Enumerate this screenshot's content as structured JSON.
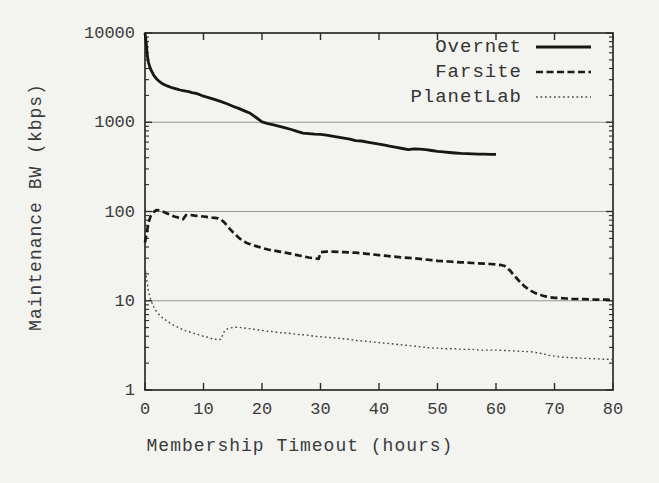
{
  "chart_data": {
    "type": "line",
    "title": "",
    "xlabel": "Membership Timeout (hours)",
    "ylabel": "Maintenance BW (kbps)",
    "x_axis": {
      "min": 0,
      "max": 80,
      "ticks": [
        0,
        10,
        20,
        30,
        40,
        50,
        60,
        70,
        80
      ],
      "label": "Membership Timeout (hours)"
    },
    "y_axis": {
      "scale": "log",
      "min": 1,
      "max": 10000,
      "ticks": [
        1,
        10,
        100,
        1000,
        10000
      ],
      "tick_labels": [
        "1",
        "10",
        "100",
        "1000",
        "10000"
      ],
      "gridlines": [
        10,
        100,
        1000
      ],
      "label": "Maintenance BW (kbps)"
    },
    "legend_position": "top-right",
    "grid": "horizontal-decades",
    "colors": {
      "line": "#1c1c1c",
      "dotted_line": "#454545",
      "axis": "#2b2b2b",
      "grid": "#969696",
      "background": "#f3f3f0"
    },
    "series": [
      {
        "name": "Overnet",
        "style": "solid",
        "dash": "",
        "stroke_width": 2.8,
        "color": "#161616",
        "points": [
          [
            0,
            10000
          ],
          [
            0.2,
            7800
          ],
          [
            0.4,
            5600
          ],
          [
            0.6,
            4700
          ],
          [
            0.8,
            4200
          ],
          [
            1,
            3900
          ],
          [
            1.5,
            3350
          ],
          [
            2,
            3050
          ],
          [
            2.5,
            2850
          ],
          [
            3,
            2700
          ],
          [
            3.5,
            2600
          ],
          [
            4,
            2520
          ],
          [
            4.5,
            2450
          ],
          [
            5,
            2400
          ],
          [
            5.5,
            2350
          ],
          [
            6,
            2300
          ],
          [
            6.5,
            2260
          ],
          [
            7,
            2230
          ],
          [
            7.5,
            2200
          ],
          [
            8,
            2150
          ],
          [
            8.5,
            2120
          ],
          [
            9,
            2080
          ],
          [
            9.5,
            2020
          ],
          [
            10,
            1960
          ],
          [
            11,
            1880
          ],
          [
            12,
            1790
          ],
          [
            13,
            1700
          ],
          [
            14,
            1610
          ],
          [
            15,
            1510
          ],
          [
            16,
            1430
          ],
          [
            17,
            1340
          ],
          [
            18,
            1260
          ],
          [
            19,
            1130
          ],
          [
            20,
            1010
          ],
          [
            21,
            965
          ],
          [
            22,
            935
          ],
          [
            23,
            900
          ],
          [
            24,
            865
          ],
          [
            25,
            830
          ],
          [
            26,
            790
          ],
          [
            27,
            755
          ],
          [
            28,
            745
          ],
          [
            29,
            735
          ],
          [
            30,
            730
          ],
          [
            31,
            718
          ],
          [
            32,
            700
          ],
          [
            33,
            682
          ],
          [
            34,
            662
          ],
          [
            35,
            645
          ],
          [
            36,
            622
          ],
          [
            37,
            616
          ],
          [
            38,
            600
          ],
          [
            39,
            583
          ],
          [
            40,
            568
          ],
          [
            41,
            553
          ],
          [
            42,
            538
          ],
          [
            43,
            523
          ],
          [
            44,
            508
          ],
          [
            45,
            493
          ],
          [
            46,
            504
          ],
          [
            47,
            500
          ],
          [
            48,
            494
          ],
          [
            49,
            483
          ],
          [
            50,
            472
          ],
          [
            51,
            465
          ],
          [
            52,
            458
          ],
          [
            53,
            452
          ],
          [
            54,
            448
          ],
          [
            55,
            445
          ],
          [
            56,
            442
          ],
          [
            57,
            440
          ],
          [
            58,
            438
          ],
          [
            59,
            437
          ],
          [
            60,
            436
          ]
        ]
      },
      {
        "name": "Farsite",
        "style": "dashed",
        "dash": "7 3.5",
        "stroke_width": 2.7,
        "color": "#1a1a1a",
        "points": [
          [
            0,
            45
          ],
          [
            0.3,
            58
          ],
          [
            0.6,
            75
          ],
          [
            1,
            90
          ],
          [
            1.5,
            99
          ],
          [
            2,
            104
          ],
          [
            2.5,
            103
          ],
          [
            3,
            100
          ],
          [
            3.5,
            97
          ],
          [
            4,
            94
          ],
          [
            4.5,
            91
          ],
          [
            5,
            88
          ],
          [
            5.5,
            86
          ],
          [
            6,
            84
          ],
          [
            6.5,
            82
          ],
          [
            7,
            91
          ],
          [
            7.5,
            92
          ],
          [
            8,
            91
          ],
          [
            8.5,
            90
          ],
          [
            9,
            89
          ],
          [
            9.5,
            88.5
          ],
          [
            10,
            88
          ],
          [
            10.5,
            87
          ],
          [
            11,
            86
          ],
          [
            11.5,
            85.5
          ],
          [
            12,
            85
          ],
          [
            12.5,
            84
          ],
          [
            13,
            81
          ],
          [
            13.5,
            76
          ],
          [
            14,
            70
          ],
          [
            14.5,
            64
          ],
          [
            15,
            59
          ],
          [
            15.5,
            55
          ],
          [
            16,
            51
          ],
          [
            16.5,
            48
          ],
          [
            17,
            46
          ],
          [
            17.5,
            44
          ],
          [
            18,
            43
          ],
          [
            19,
            41
          ],
          [
            20,
            39
          ],
          [
            21,
            37.5
          ],
          [
            22,
            36.5
          ],
          [
            23,
            35.5
          ],
          [
            24,
            34.5
          ],
          [
            25,
            33.5
          ],
          [
            26,
            32.5
          ],
          [
            27,
            31.5
          ],
          [
            28,
            30.5
          ],
          [
            29,
            29.8
          ],
          [
            29.7,
            29.5
          ],
          [
            30,
            35
          ],
          [
            31,
            35.5
          ],
          [
            32,
            35.5
          ],
          [
            33,
            35.3
          ],
          [
            34,
            35
          ],
          [
            35,
            34.8
          ],
          [
            36,
            34.5
          ],
          [
            37,
            34
          ],
          [
            38,
            33.5
          ],
          [
            39,
            33
          ],
          [
            40,
            32.5
          ],
          [
            41,
            32
          ],
          [
            42,
            31.5
          ],
          [
            43,
            31
          ],
          [
            44,
            30.5
          ],
          [
            45,
            30.2
          ],
          [
            46,
            30
          ],
          [
            47,
            29.5
          ],
          [
            48,
            29
          ],
          [
            49,
            28.5
          ],
          [
            50,
            28
          ],
          [
            51,
            27.8
          ],
          [
            52,
            27.5
          ],
          [
            53,
            27.2
          ],
          [
            54,
            27
          ],
          [
            55,
            26.8
          ],
          [
            56,
            26.5
          ],
          [
            57,
            26.3
          ],
          [
            58,
            26
          ],
          [
            59,
            25.8
          ],
          [
            60,
            25.5
          ],
          [
            61,
            25
          ],
          [
            61.5,
            24.5
          ],
          [
            62,
            23
          ],
          [
            62.5,
            21.5
          ],
          [
            63,
            19.5
          ],
          [
            63.5,
            18
          ],
          [
            64,
            16.5
          ],
          [
            64.5,
            15.3
          ],
          [
            65,
            14.3
          ],
          [
            65.5,
            13.5
          ],
          [
            66,
            12.9
          ],
          [
            66.5,
            12.4
          ],
          [
            67,
            12
          ],
          [
            67.5,
            11.7
          ],
          [
            68,
            11.4
          ],
          [
            68.5,
            11.2
          ],
          [
            69,
            11
          ],
          [
            70,
            10.8
          ],
          [
            71,
            10.7
          ],
          [
            72,
            10.6
          ],
          [
            73,
            10.5
          ],
          [
            74,
            10.45
          ],
          [
            75,
            10.4
          ],
          [
            76,
            10.35
          ],
          [
            77,
            10.3
          ],
          [
            78,
            10.3
          ],
          [
            79,
            10.28
          ],
          [
            80,
            10.25
          ]
        ]
      },
      {
        "name": "PlanetLab",
        "style": "dotted",
        "dash": "1.7 2.8",
        "stroke_width": 1.4,
        "color": "#454545",
        "points": [
          [
            0,
            24
          ],
          [
            0.3,
            17
          ],
          [
            0.6,
            12.5
          ],
          [
            1,
            10.2
          ],
          [
            1.5,
            8.5
          ],
          [
            2,
            7.5
          ],
          [
            2.5,
            6.9
          ],
          [
            3,
            6.4
          ],
          [
            3.5,
            6.1
          ],
          [
            4,
            5.8
          ],
          [
            4.5,
            5.5
          ],
          [
            5,
            5.3
          ],
          [
            5.5,
            5.1
          ],
          [
            6,
            4.9
          ],
          [
            6.5,
            4.75
          ],
          [
            7,
            4.6
          ],
          [
            7.5,
            4.5
          ],
          [
            8,
            4.4
          ],
          [
            8.5,
            4.3
          ],
          [
            9,
            4.2
          ],
          [
            9.5,
            4.1
          ],
          [
            10,
            4.0
          ],
          [
            10.5,
            3.95
          ],
          [
            11,
            3.85
          ],
          [
            11.5,
            3.75
          ],
          [
            12,
            3.7
          ],
          [
            12.5,
            3.65
          ],
          [
            13,
            3.7
          ],
          [
            13.3,
            4.2
          ],
          [
            13.6,
            4.6
          ],
          [
            14,
            4.8
          ],
          [
            14.5,
            4.95
          ],
          [
            15,
            5.0
          ],
          [
            15.5,
            5.05
          ],
          [
            16,
            5.05
          ],
          [
            16.5,
            5.0
          ],
          [
            17,
            4.95
          ],
          [
            18,
            4.85
          ],
          [
            19,
            4.75
          ],
          [
            20,
            4.65
          ],
          [
            21,
            4.55
          ],
          [
            22,
            4.5
          ],
          [
            23,
            4.4
          ],
          [
            24,
            4.35
          ],
          [
            25,
            4.3
          ],
          [
            26,
            4.2
          ],
          [
            27,
            4.15
          ],
          [
            28,
            4.1
          ],
          [
            29,
            4.0
          ],
          [
            30,
            3.95
          ],
          [
            31,
            3.9
          ],
          [
            32,
            3.85
          ],
          [
            33,
            3.8
          ],
          [
            34,
            3.75
          ],
          [
            35,
            3.7
          ],
          [
            36,
            3.6
          ],
          [
            37,
            3.55
          ],
          [
            38,
            3.5
          ],
          [
            39,
            3.45
          ],
          [
            40,
            3.4
          ],
          [
            41,
            3.35
          ],
          [
            42,
            3.3
          ],
          [
            43,
            3.25
          ],
          [
            44,
            3.2
          ],
          [
            45,
            3.15
          ],
          [
            46,
            3.1
          ],
          [
            47,
            3.05
          ],
          [
            48,
            3.0
          ],
          [
            49,
            2.95
          ],
          [
            50,
            2.95
          ],
          [
            51,
            2.9
          ],
          [
            52,
            2.9
          ],
          [
            53,
            2.9
          ],
          [
            54,
            2.85
          ],
          [
            55,
            2.85
          ],
          [
            56,
            2.85
          ],
          [
            57,
            2.8
          ],
          [
            58,
            2.8
          ],
          [
            59,
            2.8
          ],
          [
            60,
            2.8
          ],
          [
            61,
            2.78
          ],
          [
            62,
            2.76
          ],
          [
            63,
            2.74
          ],
          [
            64,
            2.72
          ],
          [
            65,
            2.7
          ],
          [
            66,
            2.68
          ],
          [
            67,
            2.62
          ],
          [
            68,
            2.55
          ],
          [
            69,
            2.45
          ],
          [
            70,
            2.4
          ],
          [
            71,
            2.35
          ],
          [
            72,
            2.32
          ],
          [
            73,
            2.3
          ],
          [
            74,
            2.28
          ],
          [
            75,
            2.27
          ],
          [
            76,
            2.25
          ],
          [
            77,
            2.24
          ],
          [
            78,
            2.22
          ],
          [
            79,
            2.21
          ],
          [
            80,
            2.2
          ]
        ]
      }
    ]
  }
}
